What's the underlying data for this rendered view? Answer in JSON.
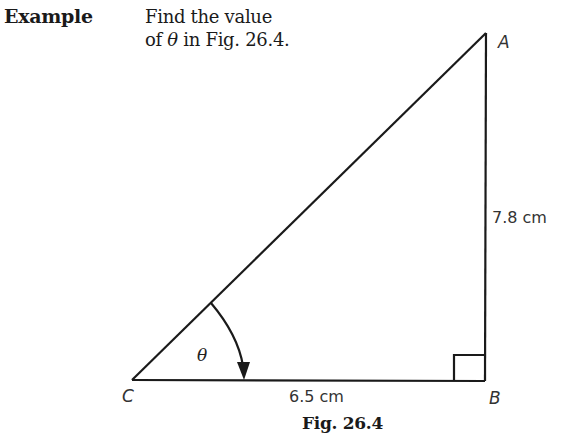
{
  "header": {
    "label": "Example",
    "problem_line1": "Find the value",
    "problem_line2_prefix": "of ",
    "problem_theta": "θ",
    "problem_line2_suffix": "  in Fig. 26.4."
  },
  "figure": {
    "vertices": {
      "A": {
        "label": "A",
        "x": 486,
        "y": 33
      },
      "B": {
        "label": "B",
        "x": 485,
        "y": 381
      },
      "C": {
        "label": "C",
        "x": 132,
        "y": 380
      }
    },
    "sides": {
      "AB": {
        "label": "7.8 cm"
      },
      "CB": {
        "label": "6.5 cm"
      }
    },
    "angle": {
      "label": "θ",
      "at_vertex": "C"
    },
    "right_angle_at": "B",
    "caption": "Fig. 26.4",
    "line_color": "#1a1a1a"
  }
}
